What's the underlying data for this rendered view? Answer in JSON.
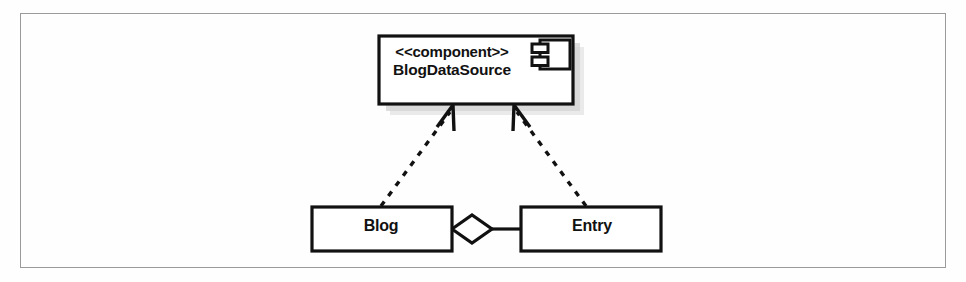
{
  "figure": {
    "kind": "uml-component-diagram",
    "background_color": "#fefefe",
    "frame_color": "#9a9a9a",
    "line_color": "#111111",
    "shadow_color": "#b9b9b9"
  },
  "component": {
    "stereotype": "<<component>>",
    "name": "BlogDataSource",
    "icon": "component-icon",
    "has_shadow": true
  },
  "classes": [
    {
      "name": "Blog"
    },
    {
      "name": "Entry"
    }
  ],
  "relationships": [
    {
      "kind": "realization",
      "line_style": "dashed",
      "arrowhead": "open",
      "from": "Blog",
      "to": "BlogDataSource"
    },
    {
      "kind": "realization",
      "line_style": "dashed",
      "arrowhead": "open",
      "from": "Entry",
      "to": "BlogDataSource"
    },
    {
      "kind": "aggregation",
      "line_style": "solid",
      "arrowhead": "hollow-diamond",
      "from": "Blog",
      "to": "Entry"
    }
  ]
}
